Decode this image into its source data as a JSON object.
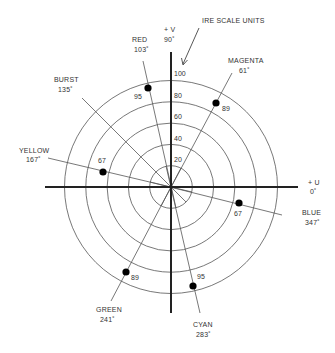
{
  "diagram": {
    "type": "vectorscope-graticule",
    "annotation": "IRE SCALE UNITS",
    "center": {
      "x": 171,
      "y": 187
    },
    "px_per_ire": 1.06,
    "rings_ire": [
      20,
      40,
      60,
      80,
      100
    ],
    "scale_labels": [
      "100",
      "80",
      "60",
      "40",
      "20"
    ],
    "axes": {
      "v": {
        "label": "+ V",
        "angle": "90˚"
      },
      "u": {
        "label": "+ U",
        "angle": "0˚"
      }
    },
    "vectors": [
      {
        "name": "RED",
        "angle_deg": 103,
        "angle_label": "103˚",
        "magnitude": 95,
        "magnitude_label": "95",
        "has_dot": true
      },
      {
        "name": "MAGENTA",
        "angle_deg": 61,
        "angle_label": "61˚",
        "magnitude": 89,
        "magnitude_label": "89",
        "has_dot": true
      },
      {
        "name": "BURST",
        "angle_deg": 135,
        "angle_label": "135˚",
        "magnitude": null,
        "magnitude_label": "",
        "has_dot": false
      },
      {
        "name": "YELLOW",
        "angle_deg": 167,
        "angle_label": "167˚",
        "magnitude": 67,
        "magnitude_label": "67",
        "has_dot": true
      },
      {
        "name": "BLUE",
        "angle_deg": 347,
        "angle_label": "347˚",
        "magnitude": 67,
        "magnitude_label": "67",
        "has_dot": true
      },
      {
        "name": "GREEN",
        "angle_deg": 241,
        "angle_label": "241˚",
        "magnitude": 89,
        "magnitude_label": "89",
        "has_dot": true
      },
      {
        "name": "CYAN",
        "angle_deg": 283,
        "angle_label": "283˚",
        "magnitude": 95,
        "magnitude_label": "95",
        "has_dot": true
      }
    ]
  }
}
